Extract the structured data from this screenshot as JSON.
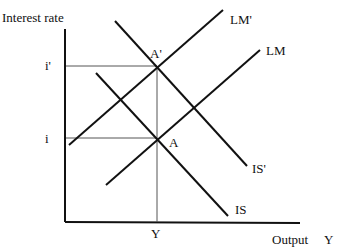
{
  "diagram": {
    "y_axis_label": "Interest rate",
    "x_axis_label": "Output",
    "x_axis_symbol": "Y",
    "ticks": {
      "i_prime": "i'",
      "i": "i",
      "y": "Y"
    },
    "curves": {
      "lm_prime": "LM'",
      "lm": "LM",
      "is_prime": "IS'",
      "is": "IS"
    },
    "points": {
      "a_prime": "A'",
      "a": "A"
    }
  }
}
